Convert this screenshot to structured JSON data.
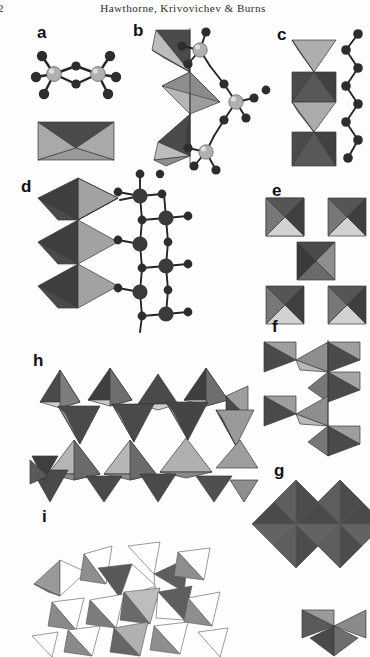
{
  "page": {
    "folio": "2",
    "running_head": "Hawthorne, Krivovichev & Burns",
    "background_color": "#ffffff",
    "ink_color": "#2b2b2b"
  },
  "figure": {
    "kind": "crystal-structure-plate",
    "rendering": "grayscale halftone",
    "palette": {
      "polyhedron_dark": "#4f4f4f",
      "polyhedron_darker": "#3c3c3c",
      "polyhedron_mid": "#6e6e6e",
      "polyhedron_light": "#a8a8a8",
      "polyhedron_lighter": "#c2c2c2",
      "polyhedron_pale": "#d6d6d6",
      "edge": "#2a2a2a",
      "atom_anion": "#2d2d2d",
      "atom_cation": "#b9b9b9"
    },
    "panels": [
      {
        "label": "a",
        "caption_text": "a",
        "motif": "edge-sharing dimer",
        "representations": [
          "ball-and-stick",
          "polyhedral"
        ],
        "polyhedra_count": 2,
        "polyhedron_type": "tetrahedron",
        "linkage": "edge-sharing",
        "dimensionality": "0D cluster"
      },
      {
        "label": "b",
        "caption_text": "b",
        "motif": "corner-sharing zigzag chain",
        "representations": [
          "polyhedral",
          "ball-and-stick"
        ],
        "polyhedra_count": 4,
        "polyhedron_type": "tetrahedron",
        "linkage": "corner-sharing",
        "dimensionality": "1D chain"
      },
      {
        "label": "c",
        "caption_text": "c",
        "motif": "vertex-linked tetrahedral chain",
        "representations": [
          "polyhedral",
          "ball-and-stick"
        ],
        "polyhedra_count": 5,
        "polyhedron_type": "tetrahedron",
        "linkage": "corner-sharing",
        "dimensionality": "1D chain"
      },
      {
        "label": "d",
        "caption_text": "d",
        "motif": "corner-sharing octahedral chain",
        "representations": [
          "polyhedral",
          "ball-and-stick"
        ],
        "polyhedra_count": 3,
        "polyhedron_type": "octahedron",
        "linkage": "corner-sharing",
        "dimensionality": "1D chain"
      },
      {
        "label": "e",
        "caption_text": "e",
        "motif": "cross-linked square clusters",
        "representations": [
          "polyhedral"
        ],
        "polyhedra_count": 5,
        "polyhedron_type": "tetrahedron-cluster",
        "linkage": "corner-sharing",
        "dimensionality": "2D sheet"
      },
      {
        "label": "f",
        "caption_text": "f",
        "motif": "open hexagonal net of bowtie pairs",
        "representations": [
          "polyhedral"
        ],
        "polyhedra_count": 8,
        "polyhedron_type": "tetrahedron",
        "linkage": "corner-sharing",
        "dimensionality": "2D sheet"
      },
      {
        "label": "g",
        "caption_text": "g",
        "motif": "densely packed triangular tiling",
        "representations": [
          "polyhedral"
        ],
        "polyhedra_count": 16,
        "polyhedron_type": "tetrahedron",
        "linkage": "edge-sharing",
        "dimensionality": "2D sheet"
      },
      {
        "label": "h",
        "caption_text": "h",
        "motif": "three-dimensional tetrahedral framework",
        "representations": [
          "polyhedral"
        ],
        "polyhedra_count": 20,
        "polyhedron_type": "tetrahedron",
        "linkage": "corner-sharing",
        "dimensionality": "3D framework"
      },
      {
        "label": "i",
        "caption_text": "i",
        "motif": "open tetrahedral framework, lighter shading",
        "representations": [
          "polyhedral"
        ],
        "polyhedra_count": 16,
        "polyhedron_type": "tetrahedron",
        "linkage": "corner-sharing",
        "dimensionality": "3D framework"
      }
    ]
  }
}
